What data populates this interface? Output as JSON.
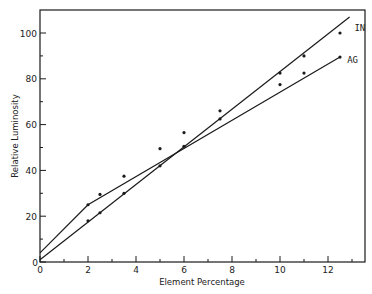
{
  "chart_data": {
    "type": "line",
    "title": "",
    "xlabel": "Element Percentage",
    "ylabel": "Relative Luminosity",
    "xlim": [
      0,
      13.5
    ],
    "ylim": [
      0,
      110
    ],
    "xticks_major": [
      0,
      2,
      4,
      6,
      8,
      10,
      12
    ],
    "xticks_minor": [
      1,
      3,
      5,
      7,
      9,
      11,
      13
    ],
    "yticks_major": [
      0,
      20,
      40,
      60,
      80,
      100
    ],
    "yticks_minor": [
      10,
      30,
      50,
      70,
      90
    ],
    "grid": false,
    "legend": "inline labels at line ends",
    "series": [
      {
        "name": "IN",
        "points": [
          [
            2,
            18
          ],
          [
            2.5,
            21.5
          ],
          [
            3.5,
            30
          ],
          [
            5,
            42
          ],
          [
            6,
            50.5
          ],
          [
            7.5,
            62.5
          ],
          [
            10,
            82.5
          ],
          [
            11,
            90
          ],
          [
            12.5,
            100
          ]
        ],
        "line": [
          [
            0,
            1
          ],
          [
            12.9,
            107
          ]
        ],
        "label_pos": [
          13.1,
          102
        ]
      },
      {
        "name": "AG",
        "points": [
          [
            2,
            25
          ],
          [
            2.5,
            29.5
          ],
          [
            3.5,
            37.5
          ],
          [
            5,
            49.5
          ],
          [
            6,
            56.5
          ],
          [
            7.5,
            66
          ],
          [
            10,
            77.5
          ],
          [
            11,
            82.5
          ],
          [
            12.5,
            89.5
          ]
        ],
        "line": [
          [
            0,
            4
          ],
          [
            2,
            25
          ],
          [
            12.5,
            89.5
          ]
        ],
        "label_pos": [
          12.8,
          88
        ]
      }
    ]
  },
  "colors": {
    "ink": "#1a1a1a",
    "background": "#ffffff"
  }
}
